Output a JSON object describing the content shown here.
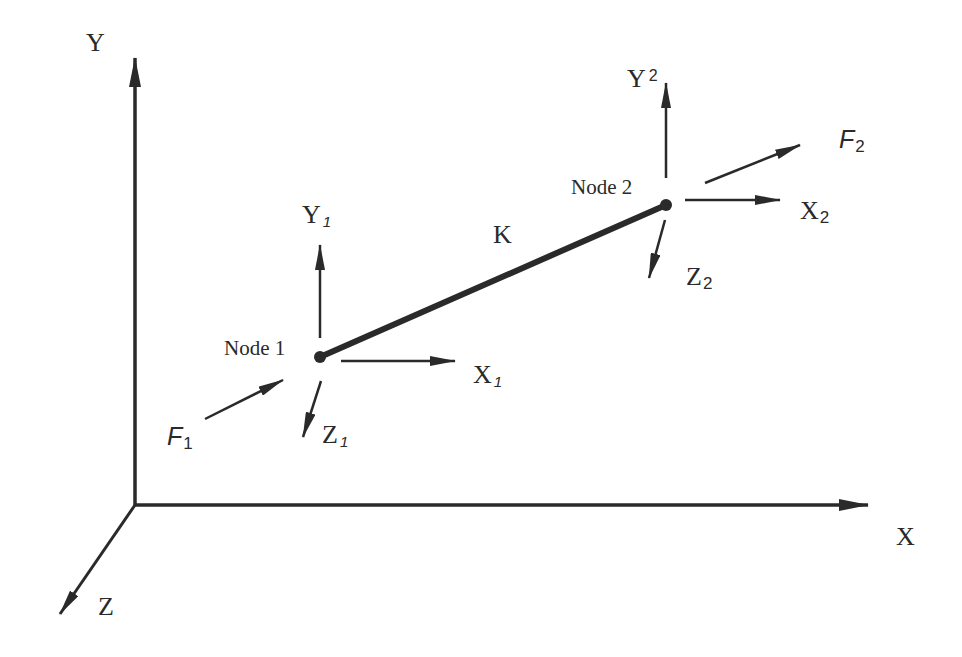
{
  "diagram": {
    "global_axes": {
      "x_label": "X",
      "y_label": "Y",
      "z_label": "Z"
    },
    "element": {
      "label": "K"
    },
    "node1": {
      "label": "Node 1",
      "axes": {
        "x": {
          "base": "X",
          "sub": "1"
        },
        "y": {
          "base": "Y",
          "sub": "1"
        },
        "z": {
          "base": "Z",
          "sub": "1"
        }
      },
      "force": {
        "base": "F",
        "sub": "1"
      }
    },
    "node2": {
      "label": "Node 2",
      "axes": {
        "x": {
          "base": "X",
          "sub": "2"
        },
        "y": {
          "base": "Y",
          "sub": "2"
        },
        "z": {
          "base": "Z",
          "sub": "2"
        }
      },
      "force": {
        "base": "F",
        "sub": "2"
      }
    },
    "colors": {
      "stroke": "#2a2a2a",
      "background": "#ffffff"
    }
  }
}
